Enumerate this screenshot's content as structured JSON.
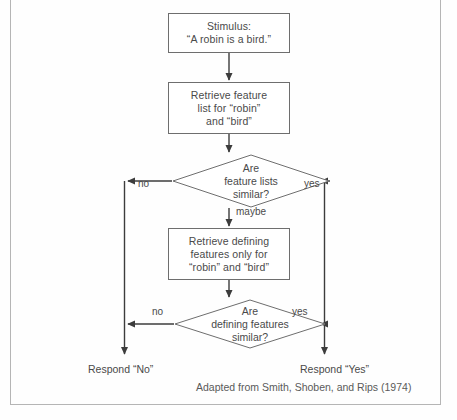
{
  "figure": {
    "attribution": "Adapted from Smith, Shoben, and Rips (1974)"
  },
  "nodes": {
    "stimulus": {
      "type": "process",
      "text": "Stimulus:\n“A robin is a bird.”"
    },
    "retrieve_features": {
      "type": "process",
      "text": "Retrieve feature\nlist for “robin”\nand “bird”"
    },
    "compare_feature_lists": {
      "type": "decision",
      "text": "Are\nfeature lists\nsimilar?"
    },
    "retrieve_defining": {
      "type": "process",
      "text": "Retrieve defining\nfeatures only for\n“robin” and “bird”"
    },
    "compare_defining": {
      "type": "decision",
      "text": "Are\ndefining features\nsimilar?"
    },
    "respond_no": {
      "type": "terminal",
      "text": "Respond “No”"
    },
    "respond_yes": {
      "type": "terminal",
      "text": "Respond “Yes”"
    }
  },
  "edges": {
    "feature_lists_no": "no",
    "feature_lists_yes": "yes",
    "feature_lists_maybe": "maybe",
    "defining_no": "no",
    "defining_yes": "yes"
  },
  "colors": {
    "stroke": "#6e6e6e",
    "arrow": "#3c3c3c",
    "text": "#4a4a4a",
    "frame": "#b5b5b5",
    "background": "#fefefe"
  }
}
